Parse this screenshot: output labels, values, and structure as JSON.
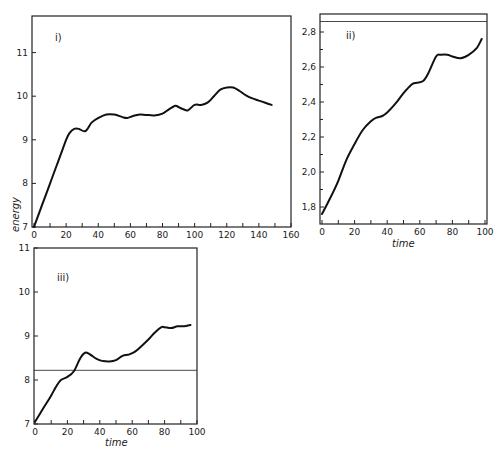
{
  "chart_data": [
    {
      "type": "line",
      "panel_label": "i)",
      "xlabel": "",
      "ylabel": "energy",
      "xlim": [
        0,
        160
      ],
      "ylim": [
        7,
        11.7
      ],
      "x_ticks": [
        0,
        20,
        40,
        60,
        80,
        100,
        120,
        140,
        160
      ],
      "y_ticks": [
        7,
        8,
        9,
        10,
        11
      ],
      "grid": false,
      "series": [
        {
          "name": "energy",
          "x": [
            0,
            5,
            10,
            15,
            20,
            22,
            25,
            28,
            32,
            36,
            40,
            45,
            50,
            55,
            58,
            62,
            66,
            70,
            75,
            80,
            84,
            88,
            90,
            93,
            96,
            100,
            104,
            108,
            112,
            116,
            120,
            124,
            128,
            132,
            136,
            140,
            144,
            148
          ],
          "y": [
            7.0,
            7.5,
            8.0,
            8.5,
            9.0,
            9.15,
            9.25,
            9.25,
            9.2,
            9.4,
            9.5,
            9.58,
            9.58,
            9.52,
            9.5,
            9.55,
            9.58,
            9.57,
            9.56,
            9.6,
            9.7,
            9.78,
            9.75,
            9.7,
            9.68,
            9.8,
            9.8,
            9.85,
            10.0,
            10.15,
            10.2,
            10.2,
            10.12,
            10.02,
            9.95,
            9.9,
            9.85,
            9.8
          ]
        }
      ]
    },
    {
      "type": "line",
      "panel_label": "ii)",
      "xlabel": "time",
      "ylabel": "",
      "xlim": [
        0,
        100
      ],
      "ylim": [
        1.7,
        2.9
      ],
      "x_ticks": [
        0,
        20,
        40,
        60,
        80,
        100
      ],
      "y_ticks": [
        1.8,
        2.0,
        2.2,
        2.4,
        2.6,
        2.8
      ],
      "y_tick_labels": [
        "1,8",
        "2,0",
        "2,2",
        "2,4",
        "2,6",
        "2,8"
      ],
      "reference_line_y": 2.86,
      "grid": false,
      "series": [
        {
          "name": "energy",
          "x": [
            0,
            5,
            10,
            15,
            20,
            25,
            30,
            33,
            37,
            40,
            45,
            50,
            55,
            58,
            62,
            65,
            70,
            73,
            77,
            80,
            85,
            90,
            95,
            98
          ],
          "y": [
            1.76,
            1.85,
            1.95,
            2.07,
            2.16,
            2.24,
            2.29,
            2.31,
            2.32,
            2.34,
            2.39,
            2.45,
            2.5,
            2.51,
            2.52,
            2.56,
            2.66,
            2.67,
            2.67,
            2.66,
            2.65,
            2.67,
            2.71,
            2.76
          ]
        }
      ]
    },
    {
      "type": "line",
      "panel_label": "iii)",
      "xlabel": "time",
      "ylabel": "",
      "xlim": [
        0,
        100
      ],
      "ylim": [
        7,
        11
      ],
      "x_ticks": [
        0,
        20,
        40,
        60,
        80,
        100
      ],
      "y_ticks": [
        7,
        8,
        9,
        10,
        11
      ],
      "reference_line_y": 8.22,
      "grid": false,
      "series": [
        {
          "name": "energy",
          "x": [
            0,
            5,
            10,
            13,
            16,
            20,
            24,
            28,
            31,
            34,
            38,
            42,
            46,
            50,
            54,
            58,
            62,
            66,
            70,
            74,
            78,
            80,
            84,
            88,
            92,
            96
          ],
          "y": [
            7.05,
            7.35,
            7.65,
            7.85,
            8.0,
            8.07,
            8.2,
            8.5,
            8.62,
            8.58,
            8.48,
            8.43,
            8.42,
            8.45,
            8.55,
            8.58,
            8.65,
            8.78,
            8.92,
            9.08,
            9.2,
            9.2,
            9.18,
            9.22,
            9.22,
            9.25
          ]
        }
      ]
    }
  ],
  "labels": {
    "panel_i": "i)",
    "panel_ii": "ii)",
    "panel_iii": "iii)",
    "y_axis_energy": "energy",
    "x_axis_time_ii": "time",
    "x_axis_time_iii": "time"
  }
}
